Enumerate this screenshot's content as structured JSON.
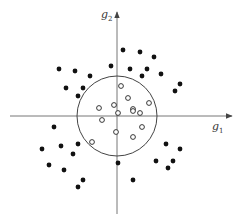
{
  "diagram": {
    "type": "scatter-classification",
    "axes": {
      "x_label": {
        "base": "g",
        "sub": "1"
      },
      "y_label": {
        "base": "g",
        "sub": "2"
      }
    },
    "boundary": {
      "shape": "circle",
      "cx": 117,
      "cy": 116,
      "r": 40
    },
    "colors": {
      "axis": "#777777",
      "filled": "#111111",
      "open_stroke": "#222222",
      "circle": "#444444"
    },
    "filled_points": [
      [
        59,
        69
      ],
      [
        75,
        71
      ],
      [
        90,
        76
      ],
      [
        111,
        66
      ],
      [
        123,
        50
      ],
      [
        140,
        52
      ],
      [
        154,
        57
      ],
      [
        130,
        69
      ],
      [
        147,
        69
      ],
      [
        142,
        76
      ],
      [
        161,
        74
      ],
      [
        180,
        84
      ],
      [
        175,
        91
      ],
      [
        66,
        88
      ],
      [
        83,
        88
      ],
      [
        78,
        96
      ],
      [
        54,
        127
      ],
      [
        42,
        149
      ],
      [
        61,
        146
      ],
      [
        78,
        144
      ],
      [
        73,
        154
      ],
      [
        49,
        165
      ],
      [
        64,
        170
      ],
      [
        83,
        180
      ],
      [
        78,
        187
      ],
      [
        118,
        163
      ],
      [
        133,
        180
      ],
      [
        166,
        144
      ],
      [
        180,
        149
      ],
      [
        156,
        161
      ],
      [
        173,
        161
      ],
      [
        168,
        168
      ]
    ],
    "open_points": [
      [
        121,
        86
      ],
      [
        128,
        98
      ],
      [
        149,
        103
      ],
      [
        99,
        108
      ],
      [
        114,
        105
      ],
      [
        133,
        109
      ],
      [
        118,
        113
      ],
      [
        133,
        111
      ],
      [
        140,
        113
      ],
      [
        102,
        120
      ],
      [
        142,
        127
      ],
      [
        116,
        132
      ],
      [
        133,
        137
      ],
      [
        92,
        142
      ]
    ]
  }
}
